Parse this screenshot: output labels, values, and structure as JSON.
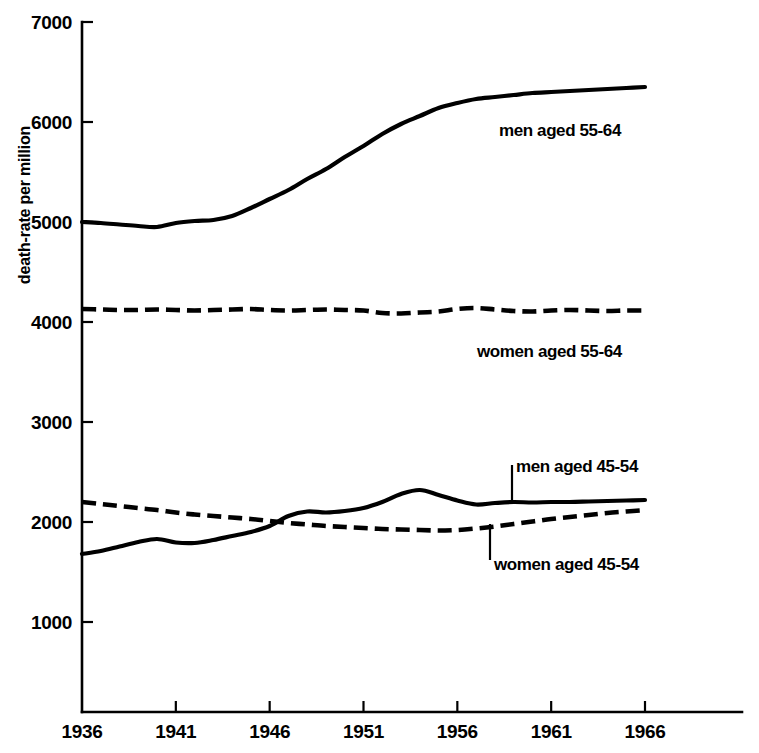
{
  "chart_data": {
    "type": "line",
    "title": "",
    "subtitle": "",
    "xlabel": "",
    "ylabel": "death-rate per million",
    "xlim": [
      1936,
      1966
    ],
    "ylim": [
      0,
      7000
    ],
    "grid": false,
    "legend_position": "inline-annotations",
    "x_ticks": [
      "1936",
      "1941",
      "1946",
      "1951",
      "1956",
      "1961",
      "1966"
    ],
    "x_tick_values": [
      1936,
      1941,
      1946,
      1951,
      1956,
      1961,
      1966
    ],
    "y_ticks": [
      "1000",
      "2000",
      "3000",
      "4000",
      "5000",
      "6000",
      "7000"
    ],
    "y_tick_values": [
      1000,
      2000,
      3000,
      4000,
      5000,
      6000,
      7000
    ],
    "x": [
      1936,
      1937,
      1938,
      1939,
      1940,
      1941,
      1942,
      1943,
      1944,
      1945,
      1946,
      1947,
      1948,
      1949,
      1950,
      1951,
      1952,
      1953,
      1954,
      1955,
      1956,
      1957,
      1958,
      1959,
      1960,
      1961,
      1962,
      1963,
      1964,
      1965,
      1966
    ],
    "series": [
      {
        "name": "men aged 55-64",
        "style": "solid",
        "label": "men aged 55-64",
        "values": [
          5000,
          4990,
          4975,
          4960,
          4950,
          4990,
          5010,
          5020,
          5060,
          5140,
          5230,
          5320,
          5430,
          5530,
          5650,
          5760,
          5880,
          5980,
          6060,
          6140,
          6190,
          6230,
          6250,
          6270,
          6290,
          6300,
          6310,
          6320,
          6330,
          6340,
          6350
        ]
      },
      {
        "name": "women aged 55-64",
        "style": "dashed",
        "label": "women aged 55-64",
        "values": [
          4130,
          4125,
          4120,
          4120,
          4125,
          4120,
          4115,
          4120,
          4125,
          4130,
          4120,
          4115,
          4120,
          4125,
          4120,
          4115,
          4090,
          4085,
          4095,
          4105,
          4130,
          4140,
          4125,
          4110,
          4105,
          4115,
          4120,
          4115,
          4110,
          4115,
          4115
        ]
      },
      {
        "name": "men aged 45-54",
        "style": "solid",
        "label": "men aged 45-54",
        "values": [
          1680,
          1710,
          1755,
          1800,
          1830,
          1795,
          1790,
          1820,
          1860,
          1900,
          1960,
          2060,
          2105,
          2095,
          2110,
          2140,
          2200,
          2280,
          2320,
          2270,
          2215,
          2175,
          2190,
          2200,
          2195,
          2200,
          2200,
          2205,
          2210,
          2215,
          2220
        ]
      },
      {
        "name": "women aged 45-54",
        "style": "dashed",
        "label": "women aged 45-54",
        "values": [
          2200,
          2180,
          2160,
          2140,
          2120,
          2095,
          2075,
          2060,
          2045,
          2030,
          2010,
          1990,
          1975,
          1960,
          1950,
          1940,
          1930,
          1925,
          1920,
          1915,
          1920,
          1935,
          1955,
          1980,
          2005,
          2030,
          2050,
          2070,
          2090,
          2105,
          2120
        ]
      }
    ],
    "annotations": [
      {
        "text": "men aged 55-64",
        "leader": false
      },
      {
        "text": "women aged 55-64",
        "leader": false
      },
      {
        "text": "men aged 45-54",
        "leader": true
      },
      {
        "text": "women aged 45-54",
        "leader": true
      }
    ],
    "colors": {
      "line": "#000000",
      "background": "#ffffff",
      "axis": "#000000"
    }
  }
}
